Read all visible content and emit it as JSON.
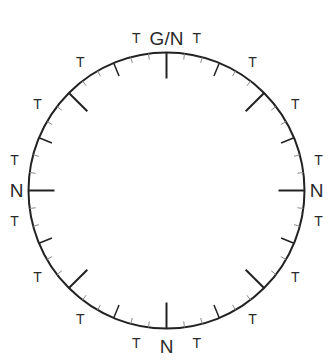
{
  "diagram": {
    "colors": {
      "line": "#222222",
      "minor_tick": "#8a8a8a",
      "text": "#2a2a2a",
      "background": "#ffffff"
    },
    "circle": {
      "cx": 166.5,
      "cy": 190.5,
      "r": 138
    },
    "ticks": {
      "step_deg": 7.5,
      "major_every_deg": 45,
      "medium_every_deg": 22.5,
      "major_len": 26,
      "medium_len": 14,
      "minor_len": 6
    },
    "cardinal_labels": [
      {
        "angle": 0,
        "text": "G/N",
        "offset": 14
      },
      {
        "angle": 90,
        "text": "N",
        "offset": 12
      },
      {
        "angle": 180,
        "text": "N",
        "offset": 18
      },
      {
        "angle": 270,
        "text": "N",
        "offset": 12
      }
    ],
    "t_labels": {
      "text": "T",
      "angles": [
        11.25,
        33.75,
        56.25,
        78.75,
        101.25,
        123.75,
        146.25,
        168.75,
        191.25,
        213.75,
        236.25,
        258.75,
        281.25,
        303.75,
        326.25,
        348.75
      ],
      "offset": 17
    }
  }
}
